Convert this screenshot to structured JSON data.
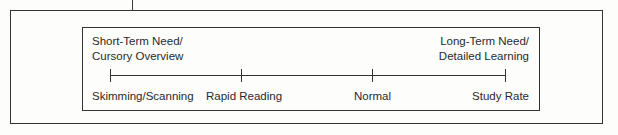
{
  "diagram": {
    "left_heading": [
      "Short-Term Need/",
      "Cursory Overview"
    ],
    "right_heading": [
      "Long-Term Need/",
      "Detailed Learning"
    ],
    "scale_points": [
      {
        "label": "Skimming/Scanning"
      },
      {
        "label": "Rapid Reading"
      },
      {
        "label": "Normal"
      },
      {
        "label": "Study Rate"
      }
    ]
  }
}
